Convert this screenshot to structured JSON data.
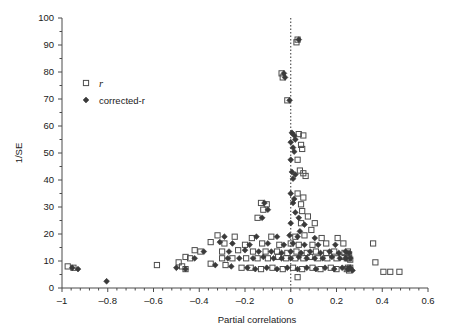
{
  "chart_data": {
    "type": "scatter",
    "title": "",
    "xlabel": "Partial correlations",
    "ylabel": "1/SE",
    "xlim": [
      -1.0,
      0.6
    ],
    "ylim": [
      0,
      100
    ],
    "xticks": [
      -1,
      -0.8,
      -0.6,
      -0.4,
      -0.2,
      0,
      0.2,
      0.4,
      0.6
    ],
    "xticklabels": [
      "–1",
      "–0.8",
      "–0.6",
      "–0.4",
      "–0.2",
      "0",
      "0.2",
      "0.4",
      "0.6"
    ],
    "yticks": [
      0,
      10,
      20,
      30,
      40,
      50,
      60,
      70,
      80,
      90,
      100
    ],
    "yticklabels": [
      "0",
      "10",
      "20",
      "30",
      "40",
      "50",
      "60",
      "70",
      "80",
      "90",
      "100"
    ],
    "xminor_count": 4,
    "yminor_count": 1,
    "grid": false,
    "reference_line": {
      "type": "vertical",
      "x": 0,
      "style": "dotted",
      "color": "#333333"
    },
    "legend": {
      "position": "upper-left-inside",
      "entries": [
        {
          "label": "r",
          "marker": "open-square",
          "italic": true,
          "color": "#4d4d4d"
        },
        {
          "label": "corrected-r",
          "marker": "filled-diamond",
          "italic": false,
          "color": "#3a3a3a"
        }
      ]
    },
    "series": [
      {
        "name": "r",
        "marker": "open-square",
        "color": "#4d4d4d",
        "points": [
          [
            0.03,
            92.0
          ],
          [
            0.025,
            91.0
          ],
          [
            -0.04,
            79.5
          ],
          [
            -0.035,
            78.0
          ],
          [
            -0.015,
            69.5
          ],
          [
            0.035,
            57.0
          ],
          [
            0.055,
            56.5
          ],
          [
            0.045,
            53.0
          ],
          [
            0.05,
            51.5
          ],
          [
            0.03,
            47.5
          ],
          [
            0.04,
            43.5
          ],
          [
            0.055,
            42.5
          ],
          [
            0.065,
            41.5
          ],
          [
            0.03,
            35.0
          ],
          [
            0.055,
            33.5
          ],
          [
            -0.13,
            31.5
          ],
          [
            -0.105,
            31.0
          ],
          [
            0.045,
            31.0
          ],
          [
            -0.12,
            29.0
          ],
          [
            0.05,
            28.5
          ],
          [
            -0.145,
            26.0
          ],
          [
            0.075,
            26.5
          ],
          [
            0.045,
            24.0
          ],
          [
            0.105,
            24.0
          ],
          [
            0.09,
            21.5
          ],
          [
            -0.32,
            19.5
          ],
          [
            -0.245,
            19.0
          ],
          [
            -0.17,
            18.5
          ],
          [
            -0.085,
            19.0
          ],
          [
            0.02,
            19.0
          ],
          [
            0.06,
            19.5
          ],
          [
            0.135,
            18.5
          ],
          [
            0.205,
            18.5
          ],
          [
            -0.35,
            17.0
          ],
          [
            -0.29,
            16.5
          ],
          [
            -0.2,
            16.0
          ],
          [
            -0.125,
            16.5
          ],
          [
            -0.05,
            16.0
          ],
          [
            0.0,
            16.5
          ],
          [
            0.035,
            16.0
          ],
          [
            0.095,
            16.0
          ],
          [
            0.155,
            16.5
          ],
          [
            0.23,
            16.5
          ],
          [
            0.36,
            16.5
          ],
          [
            -0.42,
            14.0
          ],
          [
            -0.395,
            13.5
          ],
          [
            -0.3,
            13.5
          ],
          [
            -0.23,
            14.0
          ],
          [
            -0.165,
            13.5
          ],
          [
            -0.11,
            13.5
          ],
          [
            -0.06,
            13.5
          ],
          [
            -0.015,
            13.0
          ],
          [
            0.025,
            13.5
          ],
          [
            0.07,
            13.0
          ],
          [
            0.11,
            13.5
          ],
          [
            0.155,
            13.0
          ],
          [
            0.19,
            13.5
          ],
          [
            0.235,
            13.0
          ],
          [
            0.25,
            13.5
          ],
          [
            0.255,
            12.5
          ],
          [
            -0.46,
            11.5
          ],
          [
            -0.44,
            11.0
          ],
          [
            -0.3,
            11.0
          ],
          [
            -0.255,
            11.0
          ],
          [
            -0.195,
            11.0
          ],
          [
            -0.145,
            11.0
          ],
          [
            -0.1,
            11.0
          ],
          [
            -0.055,
            11.5
          ],
          [
            -0.02,
            11.0
          ],
          [
            0.02,
            11.0
          ],
          [
            0.055,
            11.0
          ],
          [
            0.085,
            11.5
          ],
          [
            0.12,
            11.0
          ],
          [
            0.16,
            11.0
          ],
          [
            0.2,
            11.0
          ],
          [
            0.225,
            11.5
          ],
          [
            0.245,
            11.0
          ],
          [
            0.255,
            11.0
          ],
          [
            0.26,
            10.5
          ],
          [
            -0.975,
            8.0
          ],
          [
            -0.95,
            7.5
          ],
          [
            -0.585,
            8.5
          ],
          [
            -0.49,
            9.5
          ],
          [
            -0.475,
            8.0
          ],
          [
            -0.46,
            7.0
          ],
          [
            -0.35,
            9.0
          ],
          [
            -0.285,
            8.5
          ],
          [
            -0.215,
            7.5
          ],
          [
            -0.175,
            7.5
          ],
          [
            -0.13,
            7.0
          ],
          [
            -0.08,
            7.5
          ],
          [
            -0.035,
            7.0
          ],
          [
            0.01,
            7.5
          ],
          [
            0.05,
            7.0
          ],
          [
            0.095,
            7.5
          ],
          [
            0.13,
            7.0
          ],
          [
            0.175,
            7.5
          ],
          [
            0.2,
            7.0
          ],
          [
            0.245,
            7.0
          ],
          [
            0.25,
            7.5
          ],
          [
            0.255,
            6.5
          ],
          [
            0.26,
            7.5
          ],
          [
            0.37,
            9.5
          ],
          [
            0.405,
            6.0
          ],
          [
            0.435,
            6.0
          ],
          [
            0.475,
            6.0
          ],
          [
            0.03,
            4.0
          ]
        ]
      },
      {
        "name": "corrected-r",
        "marker": "filled-diamond",
        "color": "#3a3a3a",
        "points": [
          [
            0.035,
            92.0
          ],
          [
            -0.03,
            79.5
          ],
          [
            -0.025,
            78.0
          ],
          [
            -0.005,
            69.5
          ],
          [
            0.005,
            57.5
          ],
          [
            0.015,
            56.5
          ],
          [
            0.02,
            55.0
          ],
          [
            0.0,
            54.0
          ],
          [
            0.01,
            52.0
          ],
          [
            0.015,
            50.5
          ],
          [
            0.0,
            47.5
          ],
          [
            0.005,
            43.0
          ],
          [
            0.02,
            42.0
          ],
          [
            0.01,
            40.5
          ],
          [
            0.0,
            35.0
          ],
          [
            0.015,
            33.0
          ],
          [
            -0.115,
            31.5
          ],
          [
            0.01,
            31.5
          ],
          [
            -0.1,
            29.0
          ],
          [
            0.02,
            28.0
          ],
          [
            -0.125,
            26.0
          ],
          [
            0.035,
            26.0
          ],
          [
            0.0,
            24.0
          ],
          [
            0.06,
            23.5
          ],
          [
            0.04,
            21.0
          ],
          [
            -0.29,
            19.0
          ],
          [
            -0.15,
            19.0
          ],
          [
            -0.06,
            19.0
          ],
          [
            -0.005,
            19.5
          ],
          [
            0.03,
            19.0
          ],
          [
            0.105,
            18.5
          ],
          [
            -0.31,
            17.0
          ],
          [
            -0.255,
            16.5
          ],
          [
            -0.18,
            16.0
          ],
          [
            -0.1,
            16.5
          ],
          [
            -0.03,
            16.0
          ],
          [
            0.01,
            16.5
          ],
          [
            0.06,
            16.0
          ],
          [
            0.12,
            16.0
          ],
          [
            0.195,
            16.0
          ],
          [
            -0.38,
            13.5
          ],
          [
            -0.27,
            13.5
          ],
          [
            -0.2,
            14.0
          ],
          [
            -0.14,
            13.5
          ],
          [
            -0.085,
            13.5
          ],
          [
            -0.04,
            13.0
          ],
          [
            0.0,
            13.5
          ],
          [
            0.045,
            13.0
          ],
          [
            0.085,
            13.5
          ],
          [
            0.13,
            13.0
          ],
          [
            0.17,
            13.5
          ],
          [
            0.21,
            13.0
          ],
          [
            0.24,
            13.5
          ],
          [
            0.255,
            13.0
          ],
          [
            -0.42,
            11.0
          ],
          [
            -0.275,
            11.0
          ],
          [
            -0.225,
            11.0
          ],
          [
            -0.165,
            11.0
          ],
          [
            -0.12,
            11.5
          ],
          [
            -0.075,
            11.0
          ],
          [
            -0.04,
            11.0
          ],
          [
            0.0,
            11.0
          ],
          [
            0.035,
            11.5
          ],
          [
            0.07,
            11.0
          ],
          [
            0.105,
            11.0
          ],
          [
            0.14,
            11.0
          ],
          [
            0.18,
            11.5
          ],
          [
            0.215,
            11.0
          ],
          [
            0.24,
            11.0
          ],
          [
            0.26,
            11.0
          ],
          [
            -0.955,
            7.5
          ],
          [
            -0.93,
            7.0
          ],
          [
            -0.5,
            7.5
          ],
          [
            -0.46,
            7.0
          ],
          [
            -0.33,
            8.5
          ],
          [
            -0.26,
            8.0
          ],
          [
            -0.19,
            7.5
          ],
          [
            -0.155,
            7.0
          ],
          [
            -0.105,
            7.5
          ],
          [
            -0.06,
            7.0
          ],
          [
            -0.015,
            7.5
          ],
          [
            0.03,
            7.0
          ],
          [
            0.07,
            7.5
          ],
          [
            0.11,
            7.0
          ],
          [
            0.15,
            7.5
          ],
          [
            0.19,
            7.0
          ],
          [
            0.225,
            7.5
          ],
          [
            0.25,
            7.0
          ],
          [
            0.26,
            7.5
          ],
          [
            0.27,
            6.5
          ],
          [
            -0.805,
            2.5
          ]
        ]
      }
    ]
  }
}
